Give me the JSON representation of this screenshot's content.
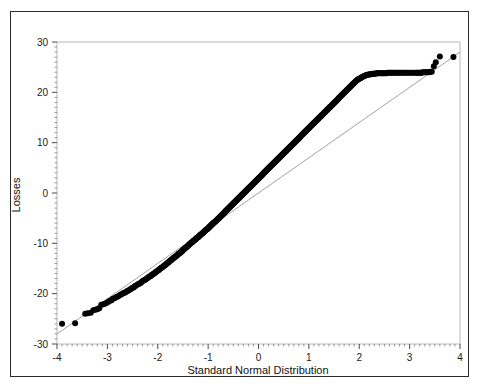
{
  "figure": {
    "background_color": "#ffffff",
    "frame_color": "#2b2b2b",
    "plot_border_color": "#b8b8b8",
    "point_color": "#000000",
    "reference_line_color": "#8a8a8a"
  },
  "chart_data": {
    "type": "scatter",
    "title": "",
    "subtitle": "",
    "xlabel": "Standard Normal Distribution",
    "ylabel": "Losses",
    "xlim": [
      -4,
      4
    ],
    "ylim": [
      -30,
      30
    ],
    "grid": false,
    "legend": null,
    "xticks": [
      -4,
      -3,
      -2,
      -1,
      0,
      1,
      2,
      3,
      4
    ],
    "xticklabels": [
      "-4",
      "-3",
      "-2",
      "-1",
      "0",
      "1",
      "2",
      "3",
      "4"
    ],
    "yticks": [
      -30,
      -20,
      -10,
      0,
      10,
      20,
      30
    ],
    "yticklabels": [
      "-30",
      "-20",
      "-10",
      "0",
      "10",
      "20",
      "30"
    ],
    "x_minor_ticks_per_interval": 10,
    "y_minor_ticks_per_interval": 10,
    "annotations": [],
    "reference_line": {
      "label": "normal reference line",
      "x": [
        -4.0,
        4.0
      ],
      "y": [
        -28.0,
        28.0
      ]
    },
    "series": [
      {
        "name": "Losses quantiles",
        "marker": "filled-circle",
        "marker_size": 3.0,
        "color": "#000000",
        "n_points": 520,
        "x": [
          -3.9,
          -3.64,
          -3.44,
          -3.39,
          -3.33,
          -3.28,
          -3.24,
          -3.2,
          -3.16,
          -3.12,
          -3.08,
          -3.05,
          -3.01,
          -2.98,
          -2.95,
          -2.92,
          -2.89,
          -2.86,
          -2.83,
          -2.8,
          -2.77,
          -2.74,
          -2.72,
          -2.69,
          -2.66,
          -2.64,
          -2.61,
          -2.59,
          -2.56,
          -2.54,
          -2.52,
          -2.49,
          -2.47,
          -2.45,
          -2.43,
          -2.4,
          -2.38,
          -2.36,
          -2.34,
          -2.32,
          -2.3,
          -2.28,
          -2.26,
          -2.24,
          -2.22,
          -2.2,
          -2.18,
          -2.16,
          -2.14,
          -2.13,
          -2.11,
          -2.09,
          -2.07,
          -2.05,
          -2.04,
          -2.02,
          -2.0,
          -1.98,
          -1.97,
          -1.95,
          -1.93,
          -1.92,
          -1.9,
          -1.88,
          -1.87,
          -1.85,
          -1.84,
          -1.82,
          -1.81,
          -1.79,
          -1.78,
          -1.76,
          -1.75,
          -1.73,
          -1.72,
          -1.7,
          -1.69,
          -1.67,
          -1.66,
          -1.65,
          -1.63,
          -1.62,
          -1.6,
          -1.59,
          -1.58,
          -1.56,
          -1.55,
          -1.54,
          -1.52,
          -1.51,
          -1.5,
          -1.48,
          -1.47,
          -1.46,
          -1.45,
          -1.43,
          -1.42,
          -1.41,
          -1.4,
          -1.38,
          -1.37,
          -1.36,
          -1.35,
          -1.33,
          -1.32,
          -1.31,
          -1.3,
          -1.29,
          -1.27,
          -1.26,
          -1.25,
          -1.24,
          -1.23,
          -1.22,
          -1.2,
          -1.19,
          -1.18,
          -1.17,
          -1.16,
          -1.15,
          -1.14,
          -1.12,
          -1.11,
          -1.1,
          -1.09,
          -1.08,
          -1.07,
          -1.06,
          -1.05,
          -1.04,
          -1.02,
          -1.01,
          -1.0,
          -0.99,
          -0.98,
          -0.97,
          -0.96,
          -0.95,
          -0.94,
          -0.93,
          -0.92,
          -0.91,
          -0.9,
          -0.89,
          -0.88,
          -0.86,
          -0.85,
          -0.84,
          -0.83,
          -0.82,
          -0.81,
          -0.8,
          -0.79,
          -0.78,
          -0.77,
          -0.76,
          -0.75,
          -0.74,
          -0.73,
          -0.72,
          -0.71,
          -0.7,
          -0.69,
          -0.68,
          -0.67,
          -0.66,
          -0.65,
          -0.64,
          -0.63,
          -0.62,
          -0.61,
          -0.6,
          -0.59,
          -0.58,
          -0.57,
          -0.56,
          -0.55,
          -0.54,
          -0.53,
          -0.52,
          -0.51,
          -0.5,
          -0.49,
          -0.48,
          -0.47,
          -0.46,
          -0.45,
          -0.44,
          -0.43,
          -0.42,
          -0.41,
          -0.4,
          -0.39,
          -0.38,
          -0.37,
          -0.36,
          -0.35,
          -0.34,
          -0.33,
          -0.32,
          -0.31,
          -0.3,
          -0.29,
          -0.28,
          -0.27,
          -0.26,
          -0.25,
          -0.24,
          -0.23,
          -0.22,
          -0.21,
          -0.2,
          -0.19,
          -0.18,
          -0.17,
          -0.16,
          -0.15,
          -0.14,
          -0.13,
          -0.12,
          -0.11,
          -0.1,
          -0.09,
          -0.08,
          -0.07,
          -0.06,
          -0.05,
          -0.04,
          -0.03,
          -0.02,
          -0.01,
          0.0,
          0.01,
          0.02,
          0.03,
          0.04,
          0.05,
          0.06,
          0.07,
          0.08,
          0.09,
          0.1,
          0.11,
          0.12,
          0.13,
          0.14,
          0.15,
          0.16,
          0.17,
          0.18,
          0.19,
          0.2,
          0.21,
          0.22,
          0.23,
          0.24,
          0.25,
          0.26,
          0.27,
          0.28,
          0.29,
          0.3,
          0.31,
          0.32,
          0.33,
          0.34,
          0.35,
          0.36,
          0.37,
          0.38,
          0.39,
          0.4,
          0.41,
          0.42,
          0.43,
          0.44,
          0.45,
          0.46,
          0.47,
          0.48,
          0.49,
          0.5,
          0.51,
          0.52,
          0.53,
          0.54,
          0.55,
          0.56,
          0.57,
          0.58,
          0.59,
          0.6,
          0.61,
          0.62,
          0.63,
          0.64,
          0.65,
          0.66,
          0.67,
          0.68,
          0.69,
          0.7,
          0.71,
          0.72,
          0.73,
          0.74,
          0.75,
          0.76,
          0.77,
          0.78,
          0.79,
          0.8,
          0.81,
          0.82,
          0.83,
          0.84,
          0.86,
          0.87,
          0.88,
          0.89,
          0.9,
          0.91,
          0.92,
          0.93,
          0.94,
          0.95,
          0.96,
          0.97,
          0.98,
          0.99,
          1.0,
          1.01,
          1.02,
          1.04,
          1.05,
          1.06,
          1.07,
          1.08,
          1.09,
          1.1,
          1.11,
          1.12,
          1.14,
          1.15,
          1.16,
          1.17,
          1.18,
          1.19,
          1.2,
          1.22,
          1.23,
          1.24,
          1.25,
          1.26,
          1.27,
          1.29,
          1.3,
          1.31,
          1.32,
          1.33,
          1.35,
          1.36,
          1.37,
          1.38,
          1.4,
          1.41,
          1.42,
          1.43,
          1.45,
          1.46,
          1.47,
          1.48,
          1.5,
          1.51,
          1.52,
          1.54,
          1.55,
          1.56,
          1.58,
          1.59,
          1.6,
          1.62,
          1.63,
          1.65,
          1.66,
          1.67,
          1.69,
          1.7,
          1.72,
          1.73,
          1.75,
          1.76,
          1.78,
          1.79,
          1.81,
          1.82,
          1.84,
          1.85,
          1.87,
          1.88,
          1.9,
          1.92,
          1.93,
          1.95,
          1.97,
          1.98,
          2.0,
          2.02,
          2.04,
          2.05,
          2.07,
          2.09,
          2.11,
          2.13,
          2.14,
          2.16,
          2.18,
          2.2,
          2.22,
          2.24,
          2.26,
          2.28,
          2.3,
          2.32,
          2.34,
          2.36,
          2.38,
          2.4,
          2.43,
          2.45,
          2.47,
          2.49,
          2.52,
          2.54,
          2.56,
          2.59,
          2.61,
          2.64,
          2.66,
          2.69,
          2.72,
          2.74,
          2.77,
          2.8,
          2.83,
          2.86,
          2.89,
          2.92,
          2.95,
          2.98,
          3.01,
          3.05,
          3.08,
          3.12,
          3.14,
          3.16,
          3.18,
          3.2,
          3.22,
          3.24,
          3.26,
          3.28,
          3.31,
          3.33,
          3.36,
          3.39,
          3.41,
          3.44,
          3.48,
          3.52,
          3.6,
          3.87
        ],
        "y": [
          -26.0,
          -25.9,
          -24.0,
          -23.9,
          -23.8,
          -23.3,
          -23.2,
          -23.1,
          -22.9,
          -22.2,
          -22.1,
          -22.0,
          -21.8,
          -21.6,
          -21.4,
          -21.3,
          -21.0,
          -20.9,
          -20.7,
          -20.6,
          -20.4,
          -20.2,
          -20.1,
          -19.9,
          -19.8,
          -19.7,
          -19.5,
          -19.4,
          -19.2,
          -19.1,
          -18.9,
          -18.8,
          -18.7,
          -18.5,
          -18.4,
          -18.2,
          -18.1,
          -18.0,
          -17.9,
          -17.7,
          -17.5,
          -17.4,
          -17.3,
          -17.2,
          -17.0,
          -16.9,
          -16.7,
          -16.6,
          -16.5,
          -16.4,
          -16.2,
          -16.1,
          -16.0,
          -15.8,
          -15.7,
          -15.6,
          -15.4,
          -15.3,
          -15.2,
          -15.0,
          -14.9,
          -14.8,
          -14.7,
          -14.5,
          -14.4,
          -14.3,
          -14.2,
          -14.0,
          -13.9,
          -13.8,
          -13.7,
          -13.5,
          -13.4,
          -13.3,
          -13.2,
          -13.0,
          -12.9,
          -12.8,
          -12.7,
          -12.6,
          -12.5,
          -12.4,
          -12.2,
          -12.1,
          -12.0,
          -11.9,
          -11.8,
          -11.7,
          -11.6,
          -11.4,
          -11.3,
          -11.2,
          -11.1,
          -11.0,
          -10.9,
          -10.8,
          -10.7,
          -10.6,
          -10.5,
          -10.3,
          -10.2,
          -10.1,
          -10.0,
          -9.9,
          -9.8,
          -9.7,
          -9.6,
          -9.5,
          -9.4,
          -9.3,
          -9.2,
          -9.1,
          -9.0,
          -8.9,
          -8.8,
          -8.7,
          -8.6,
          -8.5,
          -8.4,
          -8.3,
          -8.2,
          -8.1,
          -8.0,
          -7.9,
          -7.8,
          -7.7,
          -7.6,
          -7.5,
          -7.4,
          -7.3,
          -7.2,
          -7.1,
          -7.0,
          -6.9,
          -6.8,
          -6.7,
          -6.6,
          -6.5,
          -6.4,
          -6.3,
          -6.2,
          -6.1,
          -6.0,
          -5.9,
          -5.8,
          -5.7,
          -5.6,
          -5.5,
          -5.4,
          -5.3,
          -5.2,
          -5.1,
          -5.0,
          -4.9,
          -4.8,
          -4.7,
          -4.6,
          -4.5,
          -4.4,
          -4.3,
          -4.2,
          -4.1,
          -4.0,
          -3.9,
          -3.8,
          -3.7,
          -3.6,
          -3.5,
          -3.4,
          -3.3,
          -3.2,
          -3.1,
          -3.0,
          -2.9,
          -2.8,
          -2.7,
          -2.6,
          -2.5,
          -2.4,
          -2.3,
          -2.2,
          -2.1,
          -2.0,
          -1.9,
          -1.8,
          -1.7,
          -1.6,
          -1.5,
          -1.4,
          -1.3,
          -1.2,
          -1.1,
          -1.0,
          -0.9,
          -0.8,
          -0.7,
          -0.6,
          -0.5,
          -0.4,
          -0.3,
          -0.2,
          -0.1,
          0.0,
          0.1,
          0.2,
          0.3,
          0.4,
          0.5,
          0.6,
          0.7,
          0.8,
          0.9,
          1.0,
          1.1,
          1.2,
          1.3,
          1.4,
          1.5,
          1.6,
          1.7,
          1.8,
          1.9,
          2.0,
          2.1,
          2.2,
          2.3,
          2.4,
          2.5,
          2.6,
          2.7,
          2.8,
          2.9,
          3.0,
          3.1,
          3.2,
          3.3,
          3.4,
          3.5,
          3.6,
          3.7,
          3.8,
          3.9,
          4.0,
          4.1,
          4.2,
          4.3,
          4.4,
          4.5,
          4.6,
          4.7,
          4.8,
          4.9,
          5.0,
          5.1,
          5.2,
          5.3,
          5.4,
          5.5,
          5.6,
          5.7,
          5.8,
          5.9,
          6.0,
          6.1,
          6.2,
          6.3,
          6.4,
          6.5,
          6.6,
          6.7,
          6.8,
          6.9,
          7.0,
          7.1,
          7.2,
          7.3,
          7.4,
          7.5,
          7.6,
          7.7,
          7.8,
          7.9,
          8.0,
          8.1,
          8.2,
          8.3,
          8.4,
          8.5,
          8.6,
          8.7,
          8.8,
          8.9,
          9.0,
          9.1,
          9.2,
          9.3,
          9.4,
          9.5,
          9.6,
          9.7,
          9.8,
          9.9,
          10.0,
          10.1,
          10.2,
          10.3,
          10.4,
          10.5,
          10.6,
          10.7,
          10.8,
          10.9,
          11.0,
          11.1,
          11.2,
          11.3,
          11.5,
          11.6,
          11.7,
          11.8,
          11.9,
          12.0,
          12.1,
          12.2,
          12.3,
          12.4,
          12.5,
          12.6,
          12.7,
          12.8,
          12.9,
          13.0,
          13.1,
          13.3,
          13.4,
          13.5,
          13.6,
          13.7,
          13.8,
          13.9,
          14.0,
          14.1,
          14.3,
          14.4,
          14.5,
          14.6,
          14.7,
          14.8,
          14.9,
          15.1,
          15.2,
          15.3,
          15.4,
          15.5,
          15.6,
          15.8,
          15.9,
          16.0,
          16.1,
          16.2,
          16.4,
          16.5,
          16.6,
          16.7,
          16.9,
          17.0,
          17.1,
          17.2,
          17.4,
          17.5,
          17.6,
          17.7,
          17.9,
          18.0,
          18.1,
          18.3,
          18.4,
          18.5,
          18.7,
          18.8,
          18.9,
          19.1,
          19.2,
          19.4,
          19.5,
          19.6,
          19.8,
          19.9,
          20.1,
          20.2,
          20.4,
          20.5,
          20.7,
          20.8,
          21.0,
          21.1,
          21.3,
          21.4,
          21.6,
          21.7,
          21.9,
          22.1,
          22.2,
          22.4,
          22.5,
          22.6,
          22.7,
          22.8,
          22.9,
          23.0,
          23.1,
          23.2,
          23.3,
          23.4,
          23.4,
          23.5,
          23.5,
          23.6,
          23.6,
          23.6,
          23.7,
          23.7,
          23.7,
          23.7,
          23.8,
          23.8,
          23.8,
          23.8,
          23.8,
          23.8,
          23.8,
          23.8,
          23.8,
          23.8,
          23.9,
          23.9,
          23.9,
          23.9,
          23.9,
          23.9,
          23.9,
          23.9,
          23.9,
          23.9,
          23.9,
          23.9,
          23.9,
          23.9,
          23.9,
          23.9,
          23.9,
          23.9,
          23.9,
          23.9,
          23.9,
          23.9,
          23.9,
          23.9,
          23.9,
          23.9,
          24.0,
          24.0,
          24.0,
          24.0,
          24.0,
          24.0,
          24.1,
          24.1,
          25.2,
          26.0,
          27.1,
          27.0
        ]
      }
    ]
  }
}
